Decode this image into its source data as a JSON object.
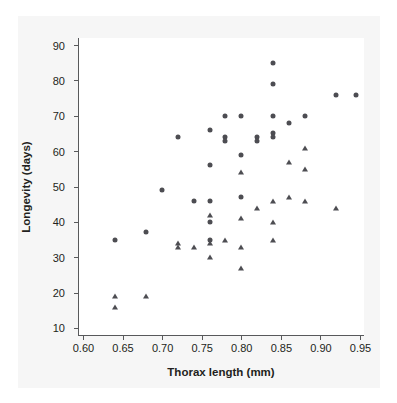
{
  "chart_data": {
    "type": "scatter",
    "title": "",
    "xlabel": "Thorax length (mm)",
    "ylabel": "Longevity (days)",
    "xlim": [
      0.595,
      0.955
    ],
    "ylim": [
      8,
      92
    ],
    "xticks": [
      "0.60",
      "0.65",
      "0.70",
      "0.75",
      "0.80",
      "0.85",
      "0.90",
      "0.95"
    ],
    "xtick_values": [
      0.6,
      0.65,
      0.7,
      0.75,
      0.8,
      0.85,
      0.9,
      0.95
    ],
    "yticks": [
      "10",
      "20",
      "30",
      "40",
      "50",
      "60",
      "70",
      "80",
      "90"
    ],
    "ytick_values": [
      10,
      20,
      30,
      40,
      50,
      60,
      70,
      80,
      90
    ],
    "grid": false,
    "legend": "none",
    "marker_color": "#4d4d52",
    "series": [
      {
        "name": "circle-group",
        "marker": "circle",
        "points": [
          [
            0.64,
            35
          ],
          [
            0.68,
            37
          ],
          [
            0.7,
            49
          ],
          [
            0.72,
            64
          ],
          [
            0.74,
            46
          ],
          [
            0.76,
            66
          ],
          [
            0.76,
            56
          ],
          [
            0.76,
            46
          ],
          [
            0.76,
            40
          ],
          [
            0.76,
            35
          ],
          [
            0.78,
            70
          ],
          [
            0.78,
            64
          ],
          [
            0.78,
            63
          ],
          [
            0.8,
            70
          ],
          [
            0.8,
            59
          ],
          [
            0.8,
            47
          ],
          [
            0.82,
            64
          ],
          [
            0.82,
            63
          ],
          [
            0.84,
            85
          ],
          [
            0.84,
            79
          ],
          [
            0.84,
            70
          ],
          [
            0.84,
            65
          ],
          [
            0.84,
            64
          ],
          [
            0.86,
            68
          ],
          [
            0.88,
            70
          ],
          [
            0.92,
            76
          ],
          [
            0.945,
            76
          ]
        ]
      },
      {
        "name": "triangle-group",
        "marker": "triangle",
        "points": [
          [
            0.64,
            19
          ],
          [
            0.64,
            16
          ],
          [
            0.68,
            19
          ],
          [
            0.72,
            34
          ],
          [
            0.72,
            33
          ],
          [
            0.74,
            33
          ],
          [
            0.76,
            42
          ],
          [
            0.76,
            34
          ],
          [
            0.76,
            30
          ],
          [
            0.78,
            35
          ],
          [
            0.8,
            54
          ],
          [
            0.8,
            41
          ],
          [
            0.8,
            33
          ],
          [
            0.8,
            27
          ],
          [
            0.82,
            44
          ],
          [
            0.84,
            46
          ],
          [
            0.84,
            40
          ],
          [
            0.84,
            35
          ],
          [
            0.86,
            57
          ],
          [
            0.86,
            47
          ],
          [
            0.88,
            61
          ],
          [
            0.88,
            55
          ],
          [
            0.88,
            46
          ],
          [
            0.92,
            44
          ]
        ]
      }
    ]
  }
}
